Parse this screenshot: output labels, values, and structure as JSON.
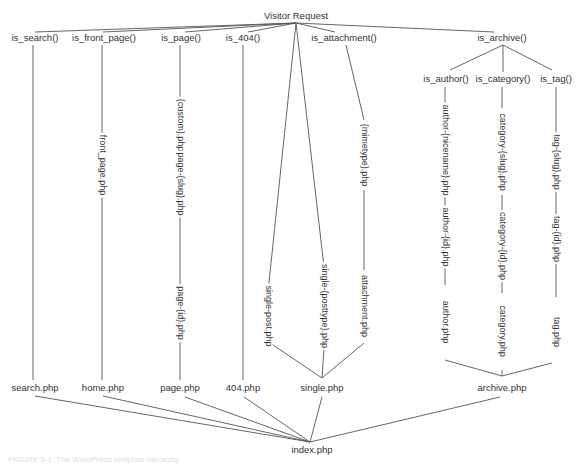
{
  "diagram": {
    "root": {
      "label": "Visitor Request"
    },
    "conditionals": [
      {
        "label": "is_search()"
      },
      {
        "label": "is_front_page()"
      },
      {
        "label": "is_page()"
      },
      {
        "label": "is_404()"
      },
      {
        "label": "is_attachment()"
      },
      {
        "label": "is_archive()"
      }
    ],
    "archive_conditionals": [
      {
        "label": "is_author()"
      },
      {
        "label": "is_category()"
      },
      {
        "label": "is_tag()"
      }
    ],
    "templates": {
      "front_page": "front_page.php",
      "page_custom": "{custom}.php",
      "page_slug": "page-{slug}.php",
      "page_id": "page-{id}.php",
      "single_post": "single-post.php",
      "single_posttype": "single-{posttype}.php",
      "mimetype": "{mimetype}.php",
      "attachment": "attachment.php",
      "author_nicename": "author-{nicename}.php",
      "author_id": "author-{id}.php",
      "author": "author.php",
      "category_slug": "category-{slug}.php",
      "category_id": "category-{id}.php",
      "category": "category.php",
      "tag_slug": "tag-{slug}.php",
      "tag_id": "tag-{id}.php",
      "tag": "tag.php"
    },
    "fallbacks": [
      {
        "label": "search.php"
      },
      {
        "label": "home.php"
      },
      {
        "label": "page.php"
      },
      {
        "label": "404.php"
      },
      {
        "label": "single.php"
      },
      {
        "label": "archive.php"
      }
    ],
    "final": {
      "label": "index.php"
    },
    "caption": "FIGURE 6-1: The WordPress template hierarchy"
  }
}
